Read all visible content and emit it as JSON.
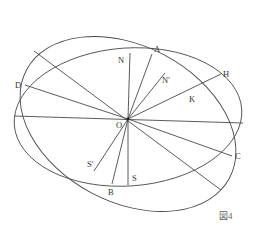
{
  "figure": {
    "caption": "図4",
    "center_label": "O",
    "labels": {
      "A": "A",
      "N": "N",
      "N_prime": "N'",
      "H": "H",
      "K": "K",
      "D": "D",
      "O": "O",
      "C": "C",
      "B": "B",
      "S": "S",
      "S_prime": "S'"
    },
    "colors": {
      "stroke": "#4a4a4a",
      "text": "#333333",
      "background": "#ffffff"
    }
  }
}
